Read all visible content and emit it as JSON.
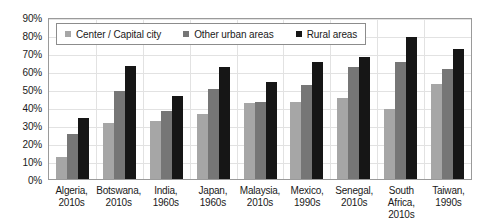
{
  "chart_data": {
    "type": "bar",
    "title": "",
    "subtitle": "",
    "xlabel": "",
    "ylabel": "",
    "ylim": [
      0,
      90
    ],
    "ytick_labels": [
      "0%",
      "10%",
      "20%",
      "30%",
      "40%",
      "50%",
      "60%",
      "70%",
      "80%",
      "90%"
    ],
    "ytick_values": [
      0,
      10,
      20,
      30,
      40,
      50,
      60,
      70,
      80,
      90
    ],
    "grid": true,
    "legend_position": "top-left-inside",
    "categories": [
      "Algeria, 2010s",
      "Botswana, 2010s",
      "India, 1960s",
      "Japan, 1960s",
      "Malaysia, 2010s",
      "Mexico, 1990s",
      "Senegal, 2010s",
      "South Africa, 2010s",
      "Taiwan, 1990s"
    ],
    "category_lines": [
      [
        "Algeria,",
        "2010s"
      ],
      [
        "Botswana,",
        "2010s"
      ],
      [
        "India,",
        "1960s"
      ],
      [
        "Japan,",
        "1960s"
      ],
      [
        "Malaysia,",
        "2010s"
      ],
      [
        "Mexico,",
        "1990s"
      ],
      [
        "Senegal,",
        "2010s"
      ],
      [
        "South",
        "Africa,",
        "2010s"
      ],
      [
        "Taiwan,",
        "1990s"
      ]
    ],
    "series": [
      {
        "name": "Center / Capital city",
        "color": "#a6a6a6",
        "values": [
          12,
          31,
          32,
          36,
          42,
          43,
          45,
          39,
          53
        ]
      },
      {
        "name": "Other urban areas",
        "color": "#767676",
        "values": [
          25,
          49,
          38,
          50,
          43,
          52,
          62,
          65,
          61
        ]
      },
      {
        "name": "Rural areas",
        "color": "#161616",
        "values": [
          34,
          63,
          46,
          62,
          54,
          65,
          68,
          79,
          72
        ]
      }
    ]
  },
  "legend": {
    "items": [
      {
        "label": "Center / Capital city"
      },
      {
        "label": "Other urban areas"
      },
      {
        "label": "Rural areas"
      }
    ]
  }
}
